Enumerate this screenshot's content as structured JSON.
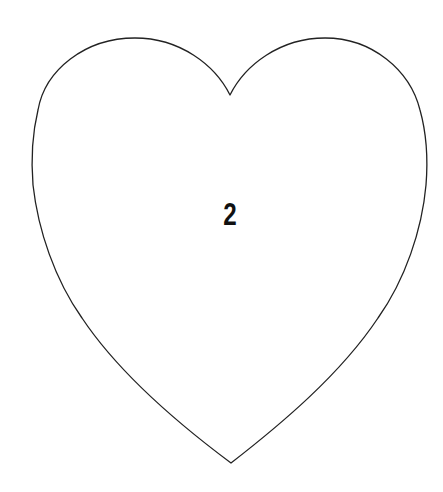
{
  "shape": {
    "type": "heart",
    "stroke_color": "#222222",
    "fill_color": "#ffffff",
    "stroke_width": 1.3
  },
  "label": {
    "text": "2",
    "color": "#111111"
  }
}
